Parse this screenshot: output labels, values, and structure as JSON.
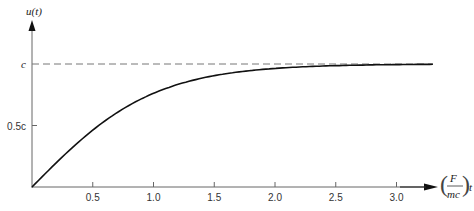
{
  "chart_data": {
    "type": "line",
    "title": "",
    "ylabel": "u(t)",
    "xlabel": "(F/mc) t",
    "xlabel_parts": {
      "num": "F",
      "den": "mc",
      "var": "t"
    },
    "x_ticks": [
      0.5,
      1.0,
      1.5,
      2.0,
      2.5,
      3.0
    ],
    "x_tick_labels": [
      "0.5",
      "1.0",
      "1.5",
      "2.0",
      "2.5",
      "3.0"
    ],
    "y_ticks": [
      0.5,
      1.0
    ],
    "y_tick_labels": [
      "0.5c",
      "c"
    ],
    "xlim": [
      0,
      3.35
    ],
    "ylim": [
      0,
      1.0
    ],
    "grid": false,
    "series": [
      {
        "name": "u(t)",
        "style": "solid",
        "x": [
          0,
          0.25,
          0.5,
          0.75,
          1.0,
          1.25,
          1.5,
          1.75,
          2.0,
          2.25,
          2.5,
          2.75,
          3.0,
          3.3
        ],
        "y": [
          0,
          0.245,
          0.462,
          0.635,
          0.762,
          0.848,
          0.905,
          0.941,
          0.964,
          0.978,
          0.987,
          0.992,
          0.995,
          0.997
        ]
      },
      {
        "name": "asymptote c",
        "style": "dashed",
        "x": [
          0,
          3.3
        ],
        "y": [
          1.0,
          1.0
        ]
      }
    ],
    "annotations": [
      "c",
      "0.5c"
    ]
  }
}
